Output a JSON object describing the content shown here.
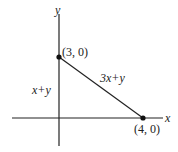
{
  "diagram": {
    "axes": {
      "x_label": "x",
      "y_label": "y"
    },
    "points": [
      {
        "label": "(3, 0)",
        "role": "y-axis intercept"
      },
      {
        "label": "(4, 0)",
        "role": "x-axis intercept"
      }
    ],
    "segment_label": "3x+y",
    "region_label": "x+y",
    "colors": {
      "line": "#222222",
      "background": "#ffffff"
    }
  }
}
